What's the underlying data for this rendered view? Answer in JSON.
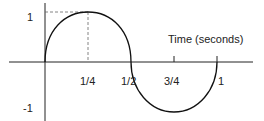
{
  "diagram": {
    "x_axis_label": "Time (seconds)",
    "y_ticks": [
      {
        "label": "1",
        "value": 1
      },
      {
        "label": "-1",
        "value": -1
      }
    ],
    "x_ticks": [
      {
        "label": "1/4",
        "value": 0.25
      },
      {
        "label": "1/2",
        "value": 0.5
      },
      {
        "label": "3/4",
        "value": 0.75
      },
      {
        "label": "1",
        "value": 1
      }
    ],
    "curve": {
      "positive_half": "upper semicircle from 0 to 1/2 peaking at 1 at t=1/4",
      "negative_half": "lower semicircle from 1/2 to 1 reaching -1 at t=3/4"
    },
    "guides": "dashed lines from y=1 to peak and from peak down to t=1/4",
    "colors": {
      "line": "#111111",
      "guide": "#666666"
    }
  }
}
